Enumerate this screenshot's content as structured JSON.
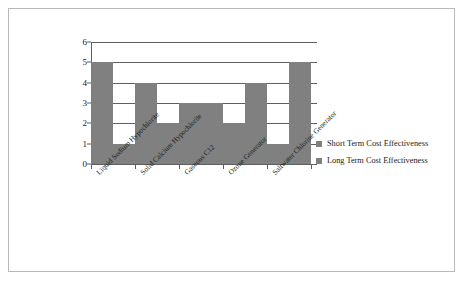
{
  "chart_data": {
    "type": "bar",
    "title": "",
    "subtitle": "",
    "xlabel": "",
    "ylabel": "",
    "ylim": [
      0,
      6
    ],
    "ytick_labels": [
      "6",
      "5",
      "4",
      "3",
      "2",
      "1",
      "0"
    ],
    "ytick_values": [
      6,
      5,
      4,
      3,
      2,
      1,
      0
    ],
    "grid": true,
    "legend_position": "right",
    "bar_color": "#808080",
    "axis_color": "#5f5f5f",
    "border_color": "#b9b9b9",
    "categories": [
      "Liquid Sodium Hypochlorite",
      "Solid Calcium Hypochlorite",
      "Gaseous C12",
      "Ozone Generator",
      "Saltwater Chlorine Generator"
    ],
    "series": [
      {
        "name": "Short Term Cost Effectiveness",
        "values": [
          5,
          4,
          3,
          2,
          1
        ]
      },
      {
        "name": "Long Term Cost Effectiveness",
        "values": [
          1,
          2,
          3,
          4,
          5
        ]
      }
    ]
  },
  "legend": {
    "items": [
      {
        "label": "Short Term Cost Effectiveness"
      },
      {
        "label": "Long Term Cost Effectiveness"
      }
    ]
  }
}
